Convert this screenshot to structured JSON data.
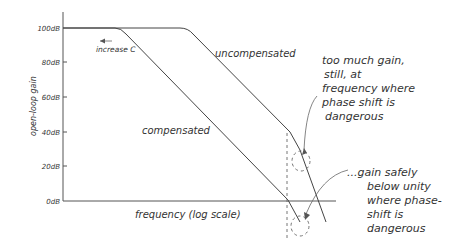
{
  "diagram": {
    "type": "hand-drawn Bode magnitude plot",
    "y_axis": {
      "label": "open-loop gain",
      "ticks": [
        "100dB",
        "80dB",
        "60dB",
        "40dB",
        "20dB",
        "0dB"
      ]
    },
    "x_axis": {
      "label": "frequency (log scale)"
    },
    "curves": {
      "uncompensated": "uncompensated",
      "compensated": "compensated"
    },
    "annotations": {
      "increase_c": "increase C",
      "too_much_gain": [
        "too much gain,",
        "still, at",
        "frequency where",
        "phase shift is",
        "dangerous"
      ],
      "gain_safely_below": [
        "...gain safely",
        "below unity",
        "where phase-",
        "shift is",
        "dangerous"
      ]
    },
    "colors": {
      "ink": "#444444",
      "background": "#ffffff"
    }
  }
}
